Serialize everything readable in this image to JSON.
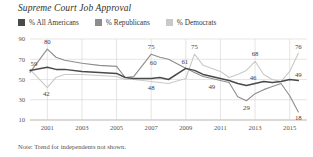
{
  "chart_title": "Supreme Court Job Approval",
  "footnote": "Note: Trend for independents not shown.",
  "legend": [
    {
      "label": "% All Americans",
      "color": "#4a4a4a",
      "swatch_name": "legend-swatch-all-americans"
    },
    {
      "label": "% Republicans",
      "color": "#8d8d8d",
      "swatch_name": "legend-swatch-republicans"
    },
    {
      "label": "% Democrats",
      "color": "#c9c9c9",
      "swatch_name": "legend-swatch-democrats"
    }
  ],
  "chart_data": {
    "type": "line",
    "title": "Supreme Court Job Approval",
    "xlabel": "",
    "ylabel": "",
    "ylim": [
      10,
      90
    ],
    "yticks": [
      10,
      30,
      50,
      70,
      90
    ],
    "xlim": [
      2000,
      2016
    ],
    "xticks": [
      2001,
      2003,
      2005,
      2007,
      2009,
      2011,
      2013,
      2015
    ],
    "grid": true,
    "legend_position": "top-left",
    "x": [
      2000,
      2001,
      2001.5,
      2002,
      2003,
      2004,
      2005,
      2005.5,
      2006,
      2007,
      2007.5,
      2008,
      2009,
      2009.5,
      2010,
      2011,
      2011.5,
      2012,
      2012.5,
      2013,
      2013.5,
      2014,
      2014.5,
      2015,
      2015.5
    ],
    "series": [
      {
        "name": "% All Americans",
        "color": "#4a4a4a",
        "values": [
          59,
          62,
          60,
          60,
          58,
          57,
          56,
          52,
          51,
          51,
          52,
          50,
          61,
          59,
          55,
          51,
          49,
          46,
          44,
          46,
          48,
          47,
          48,
          50,
          49
        ]
      },
      {
        "name": "% Republicans",
        "color": "#8d8d8d",
        "values": [
          57,
          80,
          72,
          69,
          66,
          64,
          63,
          52,
          53,
          75,
          72,
          70,
          61,
          57,
          53,
          49,
          47,
          33,
          29,
          36,
          40,
          43,
          46,
          34,
          18
        ]
      },
      {
        "name": "% Democrats",
        "color": "#c9c9c9",
        "values": [
          60,
          42,
          52,
          55,
          55,
          54,
          53,
          50,
          50,
          48,
          47,
          46,
          51,
          75,
          64,
          58,
          52,
          55,
          59,
          68,
          55,
          50,
          48,
          58,
          76
        ]
      }
    ],
    "point_labels": [
      {
        "text": "80",
        "x": 2001,
        "y": 80,
        "series": "% Republicans",
        "dx": 0,
        "dy": -5
      },
      {
        "text": "59",
        "x": 2000,
        "y": 59,
        "series": "% All Americans",
        "dx": 4,
        "dy": -4
      },
      {
        "text": "42",
        "x": 2001,
        "y": 42,
        "series": "% Democrats",
        "dx": -1,
        "dy": 8
      },
      {
        "text": "75",
        "x": 2007,
        "y": 75,
        "series": "% Republicans",
        "dx": 0,
        "dy": -5
      },
      {
        "text": "60",
        "x": 2007,
        "y": 60,
        "series": "% All Americans",
        "dx": 2,
        "dy": -4
      },
      {
        "text": "48",
        "x": 2007,
        "y": 48,
        "series": "% Democrats",
        "dx": 0,
        "dy": 8
      },
      {
        "text": "75",
        "x": 2009.5,
        "y": 75,
        "series": "% Democrats",
        "dx": 0,
        "dy": -5
      },
      {
        "text": "61",
        "x": 2009,
        "y": 61,
        "series": "% All Americans",
        "dx": -1,
        "dy": -4
      },
      {
        "text": "49",
        "x": 2010.5,
        "y": 49,
        "series": "% Republicans",
        "dx": 0,
        "dy": 8
      },
      {
        "text": "68",
        "x": 2013,
        "y": 68,
        "series": "% Democrats",
        "dx": 0,
        "dy": -5
      },
      {
        "text": "46",
        "x": 2013,
        "y": 46,
        "series": "% All Americans",
        "dx": -2,
        "dy": -4
      },
      {
        "text": "29",
        "x": 2012.5,
        "y": 29,
        "series": "% Republicans",
        "dx": 0,
        "dy": 9
      },
      {
        "text": "76",
        "x": 2015.5,
        "y": 76,
        "series": "% Democrats",
        "dx": 0,
        "dy": -4
      },
      {
        "text": "49",
        "x": 2015.5,
        "y": 49,
        "series": "% All Americans",
        "dx": 0,
        "dy": -4
      },
      {
        "text": "18",
        "x": 2015.5,
        "y": 18,
        "series": "% Republicans",
        "dx": 0,
        "dy": 8
      }
    ]
  }
}
